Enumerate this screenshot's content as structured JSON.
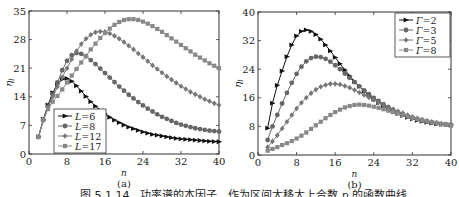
{
  "figure": {
    "caption": "图 5.1.14　功率谱的本因子　作为区间大移大上合数 n 的函数曲线"
  },
  "chart_data": [
    {
      "panel_label": "(a)",
      "type": "line",
      "xlabel": "n",
      "ylabel": "η_l",
      "xlim": [
        0,
        40
      ],
      "ylim": [
        0,
        35
      ],
      "xticks": [
        0,
        8,
        16,
        24,
        32,
        40
      ],
      "yticks": [
        0,
        7,
        14,
        21,
        28,
        35
      ],
      "grid": false,
      "legend_position": "lower-left",
      "x": [
        2,
        3,
        4,
        5,
        6,
        7,
        8,
        9,
        10,
        11,
        12,
        13,
        14,
        15,
        16,
        17,
        18,
        19,
        20,
        21,
        22,
        23,
        24,
        25,
        26,
        27,
        28,
        29,
        30,
        31,
        32,
        33,
        34,
        35,
        36,
        37,
        38,
        39,
        40
      ],
      "series": [
        {
          "name": "L=6",
          "marker": "triangle-right",
          "color": "#111111",
          "values": [
            4.2,
            8.5,
            12.0,
            15.0,
            17.2,
            18.3,
            18.5,
            17.8,
            16.7,
            15.4,
            14.1,
            12.8,
            11.7,
            10.7,
            9.8,
            9.0,
            8.3,
            7.7,
            7.1,
            6.6,
            6.2,
            5.8,
            5.4,
            5.1,
            4.8,
            4.6,
            4.4,
            4.2,
            4.0,
            3.8,
            3.7,
            3.6,
            3.5,
            3.4,
            3.3,
            3.2,
            3.1,
            3.05,
            3.0
          ]
        },
        {
          "name": "L=8",
          "marker": "circle",
          "color": "#666666",
          "values": [
            4.2,
            8.3,
            11.5,
            14.5,
            17.5,
            20.5,
            22.8,
            24.2,
            24.7,
            24.5,
            23.9,
            23.0,
            22.0,
            20.9,
            19.8,
            18.7,
            17.6,
            16.5,
            15.5,
            14.5,
            13.6,
            12.7,
            11.9,
            11.1,
            10.4,
            9.7,
            9.1,
            8.6,
            8.1,
            7.6,
            7.2,
            6.9,
            6.6,
            6.3,
            6.1,
            5.9,
            5.7,
            5.6,
            5.5
          ]
        },
        {
          "name": "L=12",
          "marker": "diamond",
          "color": "#777777",
          "values": [
            4.2,
            8.3,
            11.5,
            14.0,
            16.5,
            18.8,
            21.0,
            23.2,
            25.2,
            26.9,
            28.2,
            29.2,
            29.8,
            30.0,
            29.9,
            29.5,
            28.9,
            28.2,
            27.4,
            26.5,
            25.6,
            24.6,
            23.7,
            22.7,
            21.7,
            20.8,
            19.9,
            19.0,
            18.2,
            17.4,
            16.6,
            15.9,
            15.2,
            14.6,
            14.0,
            13.4,
            12.9,
            12.4,
            12.0
          ]
        },
        {
          "name": "L=17",
          "marker": "square",
          "color": "#888888",
          "values": [
            4.2,
            8.3,
            11.0,
            12.8,
            14.2,
            15.8,
            17.5,
            19.2,
            20.8,
            22.4,
            24.0,
            25.6,
            27.0,
            28.4,
            29.6,
            30.7,
            31.6,
            32.3,
            32.8,
            33.0,
            33.0,
            32.8,
            32.4,
            31.9,
            31.3,
            30.6,
            29.9,
            29.1,
            28.3,
            27.5,
            26.7,
            25.9,
            25.1,
            24.3,
            23.6,
            22.9,
            22.2,
            21.6,
            21.0
          ]
        }
      ]
    },
    {
      "panel_label": "(b)",
      "type": "line",
      "xlabel": "n",
      "ylabel": "η_l",
      "xlim": [
        0,
        40
      ],
      "ylim": [
        0,
        40
      ],
      "xticks": [
        0,
        8,
        16,
        24,
        32,
        40
      ],
      "yticks": [
        0,
        8,
        16,
        24,
        32,
        40
      ],
      "grid": false,
      "legend_position": "upper-right",
      "x": [
        2,
        3,
        4,
        5,
        6,
        7,
        8,
        9,
        10,
        11,
        12,
        13,
        14,
        15,
        16,
        17,
        18,
        19,
        20,
        21,
        22,
        23,
        24,
        25,
        26,
        27,
        28,
        29,
        30,
        31,
        32,
        33,
        34,
        35,
        36,
        37,
        38,
        39,
        40
      ],
      "series": [
        {
          "name": "Γ=2",
          "marker": "triangle-right",
          "color": "#111111",
          "values": [
            7.5,
            14.5,
            19.5,
            23.5,
            27.5,
            30.8,
            33.3,
            34.6,
            35.0,
            34.6,
            33.7,
            32.4,
            30.8,
            29.1,
            27.3,
            25.5,
            23.8,
            22.1,
            20.6,
            19.2,
            17.9,
            16.7,
            15.6,
            14.6,
            13.7,
            12.9,
            12.2,
            11.6,
            11.0,
            10.5,
            10.1,
            9.7,
            9.4,
            9.1,
            8.9,
            8.7,
            8.6,
            8.5,
            8.4
          ]
        },
        {
          "name": "Γ=3",
          "marker": "circle",
          "color": "#666666",
          "values": [
            4.2,
            8.0,
            11.2,
            14.4,
            17.4,
            20.2,
            22.7,
            24.7,
            26.2,
            27.1,
            27.5,
            27.4,
            26.9,
            26.1,
            25.1,
            24.0,
            22.8,
            21.6,
            20.4,
            19.2,
            18.1,
            17.0,
            16.0,
            15.1,
            14.2,
            13.4,
            12.7,
            12.0,
            11.4,
            10.9,
            10.4,
            10.0,
            9.6,
            9.3,
            9.0,
            8.8,
            8.6,
            8.5,
            8.4
          ]
        },
        {
          "name": "Γ=5",
          "marker": "diamond",
          "color": "#777777",
          "values": [
            2.2,
            3.8,
            5.5,
            7.4,
            9.3,
            11.2,
            13.0,
            14.6,
            16.0,
            17.3,
            18.3,
            19.1,
            19.6,
            19.9,
            19.9,
            19.7,
            19.3,
            18.8,
            18.2,
            17.5,
            16.8,
            16.1,
            15.4,
            14.7,
            14.0,
            13.4,
            12.8,
            12.2,
            11.7,
            11.2,
            10.7,
            10.3,
            9.9,
            9.6,
            9.3,
            9.0,
            8.8,
            8.6,
            8.4
          ]
        },
        {
          "name": "Γ=8",
          "marker": "square",
          "color": "#888888",
          "values": [
            1.2,
            1.7,
            2.2,
            2.8,
            3.3,
            3.9,
            4.6,
            5.4,
            6.3,
            7.3,
            8.3,
            9.3,
            10.3,
            11.2,
            12.0,
            12.7,
            13.3,
            13.7,
            14.0,
            14.1,
            14.0,
            13.8,
            13.5,
            13.2,
            12.8,
            12.4,
            12.0,
            11.6,
            11.2,
            10.8,
            10.4,
            10.1,
            9.8,
            9.5,
            9.2,
            9.0,
            8.7,
            8.5,
            8.2
          ]
        }
      ]
    }
  ]
}
